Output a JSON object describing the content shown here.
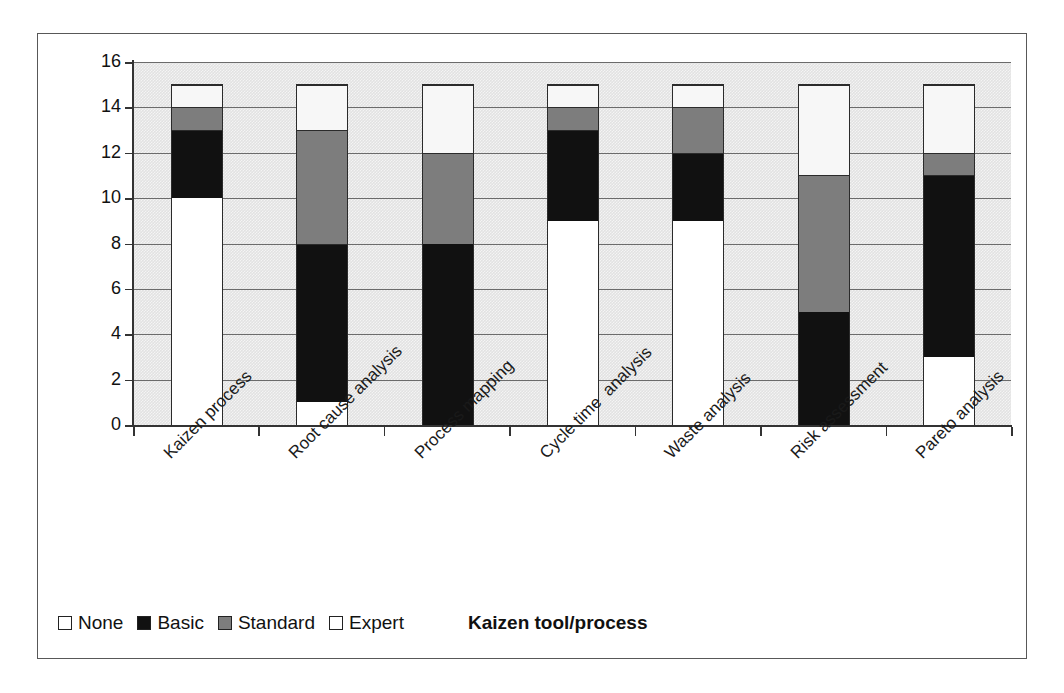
{
  "chart_data": {
    "type": "bar",
    "subtype": "stacked-vertical",
    "title": "",
    "xlabel": "Kaizen tool/process",
    "ylabel": "Number of team members",
    "ylim": [
      0,
      16
    ],
    "ytick_values": [
      0,
      2,
      4,
      6,
      8,
      10,
      12,
      14,
      16
    ],
    "ytick_labels": [
      "0",
      "2",
      "4",
      "6",
      "8",
      "10",
      "12",
      "14",
      "16"
    ],
    "grid": "horizontal",
    "legend_position": "bottom-left",
    "categories": [
      "Kaizen process",
      "Root cause analysis",
      "Process mapping",
      "Cycle time  analysis",
      "Waste analysis",
      "Risk assessment",
      "Pareto analysis"
    ],
    "series": [
      {
        "name": "None",
        "color": "#ffffff",
        "values": [
          10,
          1,
          0,
          9,
          9,
          0,
          3
        ]
      },
      {
        "name": "Basic",
        "color": "#111111",
        "values": [
          3,
          7,
          8,
          4,
          3,
          5,
          8
        ]
      },
      {
        "name": "Standard",
        "color": "#7d7d7d",
        "values": [
          1,
          5,
          4,
          1,
          2,
          6,
          1
        ]
      },
      {
        "name": "Expert",
        "color": "#f7f7f7",
        "values": [
          1,
          2,
          3,
          1,
          1,
          4,
          3
        ]
      }
    ],
    "totals": [
      15,
      15,
      15,
      15,
      15,
      15,
      15
    ],
    "cumulative_tops": [
      {
        "category": "Kaizen process",
        "none_top": 10,
        "basic_top": 13,
        "standard_top": 14,
        "expert_top": 15
      },
      {
        "category": "Root cause analysis",
        "none_top": 1,
        "basic_top": 8,
        "standard_top": 13,
        "expert_top": 15
      },
      {
        "category": "Process mapping",
        "none_top": 0,
        "basic_top": 8,
        "standard_top": 12,
        "expert_top": 15
      },
      {
        "category": "Cycle time  analysis",
        "none_top": 9,
        "basic_top": 13,
        "standard_top": 14,
        "expert_top": 15
      },
      {
        "category": "Waste analysis",
        "none_top": 9,
        "basic_top": 12,
        "standard_top": 14,
        "expert_top": 15
      },
      {
        "category": "Risk assessment",
        "none_top": 0,
        "basic_top": 5,
        "standard_top": 11,
        "expert_top": 15
      },
      {
        "category": "Pareto analysis",
        "none_top": 3,
        "basic_top": 11,
        "standard_top": 12,
        "expert_top": 15
      }
    ],
    "plot_background": "#e2e2e2",
    "frame_border_color": "#585858"
  },
  "legend": {
    "items": [
      {
        "label": "None",
        "swatch": "none"
      },
      {
        "label": "Basic",
        "swatch": "basic"
      },
      {
        "label": "Standard",
        "swatch": "standard"
      },
      {
        "label": "Expert",
        "swatch": "expert"
      }
    ]
  }
}
